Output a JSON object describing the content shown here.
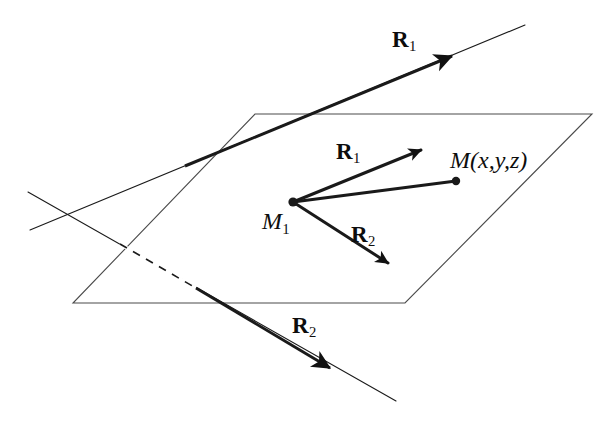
{
  "figure": {
    "background_color": "#ffffff",
    "stroke_color": "#1a1a1a",
    "thin_line_width": 1.1,
    "thick_line_width": 3.0,
    "canvas": {
      "width": 608,
      "height": 423
    }
  },
  "plane": {
    "name": "parallelogram-plane",
    "corners": [
      {
        "x": 255,
        "y": 114
      },
      {
        "x": 592,
        "y": 114
      },
      {
        "x": 405,
        "y": 303
      },
      {
        "x": 73,
        "y": 303
      }
    ],
    "fill": "none",
    "stroke": "#4a4a4a",
    "stroke_width": 1.1
  },
  "lines": [
    {
      "id": "line-r1",
      "name": "external-line-r1",
      "from": {
        "x": 30,
        "y": 230
      },
      "to": {
        "x": 525,
        "y": 25
      },
      "thick_from": {
        "x": 185,
        "y": 166
      },
      "thick_to": {
        "x": 452,
        "y": 56
      },
      "arrow_at": {
        "x": 452,
        "y": 56
      },
      "label": "R",
      "subscript": "1",
      "label_pos": {
        "x": 392,
        "y": 28
      },
      "dashed_segments": []
    },
    {
      "id": "line-r2",
      "name": "external-line-r2",
      "from": {
        "x": 28,
        "y": 192
      },
      "to": {
        "x": 396,
        "y": 401
      },
      "thick_from": {
        "x": 196,
        "y": 288
      },
      "thick_to": {
        "x": 330,
        "y": 368
      },
      "arrow_at": {
        "x": 330,
        "y": 368
      },
      "label": "R",
      "subscript": "2",
      "label_pos": {
        "x": 292,
        "y": 314
      },
      "dashed_segments": [
        {
          "from": {
            "x": 120,
            "y": 244
          },
          "to": {
            "x": 196,
            "y": 288
          }
        }
      ]
    }
  ],
  "vectors": [
    {
      "id": "vector-r1-inner",
      "name": "vector-r1-from-m1",
      "from": {
        "x": 293,
        "y": 202
      },
      "to": {
        "x": 421,
        "y": 150
      },
      "label": "R",
      "subscript": "1",
      "label_pos": {
        "x": 336,
        "y": 140
      }
    },
    {
      "id": "vector-r2-inner",
      "name": "vector-r2-from-m1",
      "from": {
        "x": 293,
        "y": 202
      },
      "to": {
        "x": 388,
        "y": 263
      },
      "label": "R",
      "subscript": "2",
      "label_pos": {
        "x": 351,
        "y": 223
      }
    },
    {
      "id": "segment-m1-m",
      "name": "segment-m1-to-m",
      "from": {
        "x": 293,
        "y": 202
      },
      "to": {
        "x": 456,
        "y": 181
      },
      "label": "",
      "subscript": "",
      "arrow": false
    }
  ],
  "points": [
    {
      "id": "point-m1",
      "name": "point-m1",
      "x": 293,
      "y": 202,
      "radius": 4.6,
      "label": "M",
      "subscript": "1",
      "label_pos": {
        "x": 262,
        "y": 209
      }
    },
    {
      "id": "point-m",
      "name": "point-m-xyz",
      "x": 456,
      "y": 181,
      "radius": 4.2,
      "label": "M(x,y,z)",
      "subscript": "",
      "label_pos": {
        "x": 450,
        "y": 148
      }
    }
  ],
  "labels": {
    "r1_top": "R",
    "r1_top_sub": "1",
    "r2_bottom": "R",
    "r2_bottom_sub": "2",
    "r1_inner": "R",
    "r1_inner_sub": "1",
    "r2_inner": "R",
    "r2_inner_sub": "2",
    "m1": "M",
    "m1_sub": "1",
    "m_point": "M(x,y,z)"
  }
}
